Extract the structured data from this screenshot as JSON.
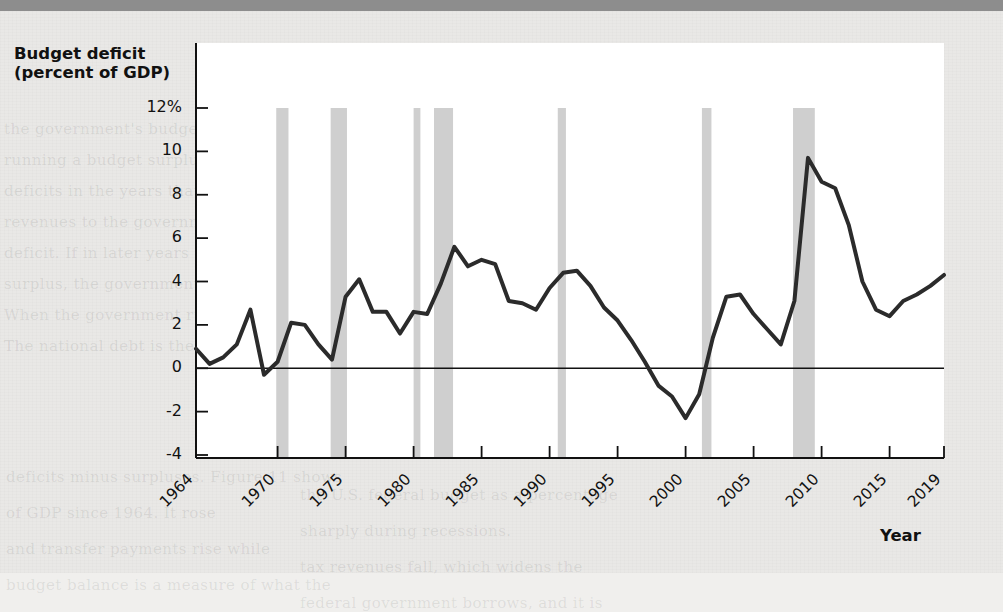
{
  "page": {
    "background_color": "#e9e8e6",
    "header_band_color": "#8d8d8d",
    "ghost_text_lines": [
      "the government's budget. If the",
      "running a budget surplus. The",
      "deficits in the years that",
      "revenues to the government",
      "deficit. If in later years",
      "surplus, the government can pay",
      "When the government runs a budget",
      "The national debt is the sum of its past",
      "deficits minus surpluses. Figure 11 shows",
      "the U.S. federal budget as a percentage",
      "of GDP since 1964. It rose",
      "sharply during recessions.",
      "and transfer payments rise while",
      "tax revenues fall, which widens the",
      "budget balance is a measure of what the",
      "federal government borrows, and it is"
    ]
  },
  "chart_data": {
    "type": "line",
    "title": "",
    "ylabel": "Budget deficit\n(percent of GDP)",
    "ylabel_line1": "Budget deficit",
    "ylabel_line2": "(percent of GDP)",
    "xlabel": "Year",
    "ylim": [
      -4,
      13
    ],
    "xlim": [
      1964,
      2019
    ],
    "ytick_labels": [
      "12%",
      "10",
      "8",
      "6",
      "4",
      "2",
      "0",
      "-2",
      "-4"
    ],
    "ytick_values": [
      12,
      10,
      8,
      6,
      4,
      2,
      0,
      -2,
      -4
    ],
    "xtick_labels": [
      "1964",
      "1970",
      "1975",
      "1980",
      "1985",
      "1990",
      "1995",
      "2000",
      "2005",
      "2010",
      "2015",
      "2019"
    ],
    "xtick_values": [
      1964,
      1970,
      1975,
      1980,
      1985,
      1990,
      1995,
      2000,
      2005,
      2010,
      2015,
      2019
    ],
    "grid": false,
    "legend": "none",
    "line_color": "#2b2b2b",
    "line_width_px": 4,
    "zero_line": 0,
    "recession_band_color": "#cfcfcf",
    "recession_bands": [
      {
        "start": 1969.9,
        "end": 1970.8
      },
      {
        "start": 1973.9,
        "end": 1975.1
      },
      {
        "start": 1980.0,
        "end": 1980.5
      },
      {
        "start": 1981.5,
        "end": 1982.9
      },
      {
        "start": 1990.6,
        "end": 1991.2
      },
      {
        "start": 2001.2,
        "end": 2001.9
      },
      {
        "start": 2007.9,
        "end": 2009.5
      }
    ],
    "x": [
      1964,
      1965,
      1966,
      1967,
      1968,
      1969,
      1970,
      1971,
      1972,
      1973,
      1974,
      1975,
      1976,
      1977,
      1978,
      1979,
      1980,
      1981,
      1982,
      1983,
      1984,
      1985,
      1986,
      1987,
      1988,
      1989,
      1990,
      1991,
      1992,
      1993,
      1994,
      1995,
      1996,
      1997,
      1998,
      1999,
      2000,
      2001,
      2002,
      2003,
      2004,
      2005,
      2006,
      2007,
      2008,
      2009,
      2010,
      2011,
      2012,
      2013,
      2014,
      2015,
      2016,
      2017,
      2018,
      2019
    ],
    "values": [
      0.9,
      0.2,
      0.5,
      1.1,
      2.7,
      -0.3,
      0.3,
      2.1,
      2.0,
      1.1,
      0.4,
      3.3,
      4.1,
      2.6,
      2.6,
      1.6,
      2.6,
      2.5,
      3.9,
      5.6,
      4.7,
      5.0,
      4.8,
      3.1,
      3.0,
      2.7,
      3.7,
      4.4,
      4.5,
      3.8,
      2.8,
      2.2,
      1.3,
      0.3,
      -0.8,
      -1.3,
      -2.3,
      -1.2,
      1.4,
      3.3,
      3.4,
      2.5,
      1.8,
      1.1,
      3.1,
      9.7,
      8.6,
      8.3,
      6.6,
      4.0,
      2.7,
      2.4,
      3.1,
      3.4,
      3.8,
      4.3
    ],
    "series_name": "Federal budget deficit (percent of GDP)",
    "annotations": [
      {
        "text": "Shaded bars indicate recessions",
        "shown": false
      }
    ]
  }
}
